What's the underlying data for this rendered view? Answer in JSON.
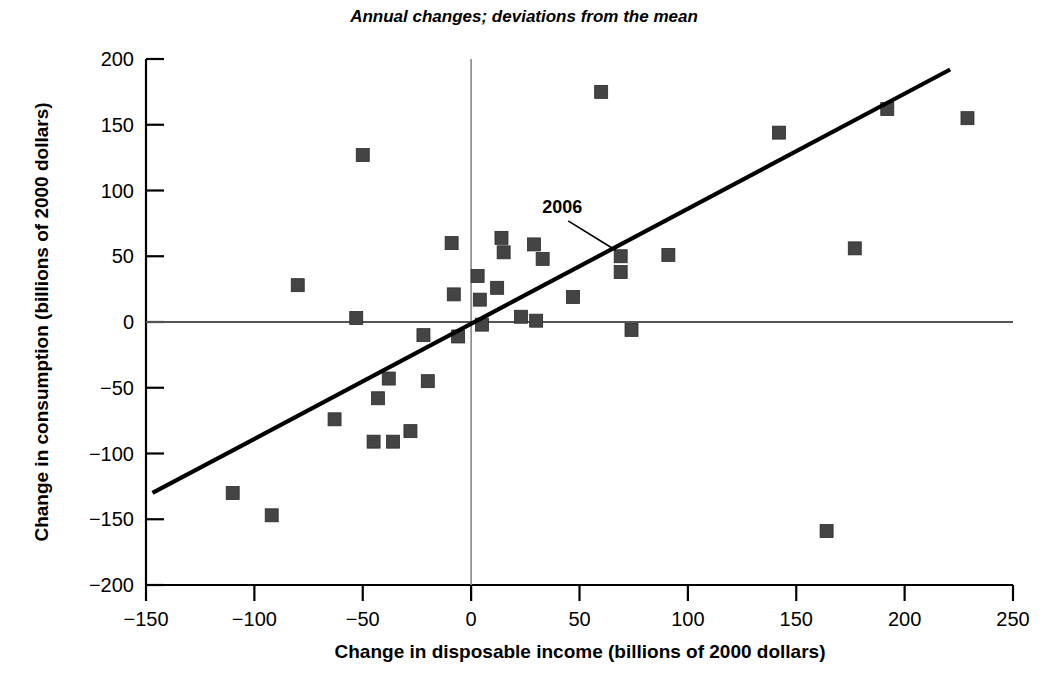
{
  "chart_data": {
    "type": "scatter",
    "title": "Annual changes; deviations from the mean",
    "xlabel": "Change in disposable income (billions of 2000 dollars)",
    "ylabel": "Change in consumption (billions of 2000 dollars)",
    "xlim": [
      -150,
      250
    ],
    "ylim": [
      -200,
      200
    ],
    "xticks": [
      -150,
      -100,
      -50,
      0,
      50,
      100,
      150,
      200,
      250
    ],
    "xtick_labels": [
      "−150",
      "−100",
      "−50",
      "0",
      "50",
      "100",
      "150",
      "200",
      "250"
    ],
    "yticks": [
      -200,
      -150,
      -100,
      -50,
      0,
      50,
      100,
      150,
      200
    ],
    "ytick_labels": [
      "−200",
      "−150",
      "−100",
      "−50",
      "0",
      "50",
      "100",
      "150",
      "200"
    ],
    "grid": false,
    "legend": "none",
    "zero_lines": {
      "x": 0,
      "y": 0
    },
    "marker": {
      "shape": "square",
      "color": "#444444",
      "size": 13
    },
    "points": [
      {
        "x": -110,
        "y": -130
      },
      {
        "x": -92,
        "y": -147
      },
      {
        "x": -80,
        "y": 28
      },
      {
        "x": -63,
        "y": -74
      },
      {
        "x": -53,
        "y": 3
      },
      {
        "x": -50,
        "y": 127
      },
      {
        "x": -45,
        "y": -91
      },
      {
        "x": -43,
        "y": -58
      },
      {
        "x": -38,
        "y": -43
      },
      {
        "x": -36,
        "y": -91
      },
      {
        "x": -28,
        "y": -83
      },
      {
        "x": -22,
        "y": -10
      },
      {
        "x": -20,
        "y": -45
      },
      {
        "x": -9,
        "y": 60
      },
      {
        "x": -8,
        "y": 21
      },
      {
        "x": -6,
        "y": -11
      },
      {
        "x": 3,
        "y": 35
      },
      {
        "x": 4,
        "y": 17
      },
      {
        "x": 5,
        "y": -2
      },
      {
        "x": 12,
        "y": 26
      },
      {
        "x": 14,
        "y": 64
      },
      {
        "x": 15,
        "y": 53
      },
      {
        "x": 23,
        "y": 4
      },
      {
        "x": 29,
        "y": 59
      },
      {
        "x": 30,
        "y": 1
      },
      {
        "x": 33,
        "y": 48
      },
      {
        "x": 47,
        "y": 19
      },
      {
        "x": 60,
        "y": 175
      },
      {
        "x": 69,
        "y": 50
      },
      {
        "x": 69,
        "y": 38
      },
      {
        "x": 74,
        "y": -6
      },
      {
        "x": 91,
        "y": 51
      },
      {
        "x": 142,
        "y": 144
      },
      {
        "x": 164,
        "y": -159
      },
      {
        "x": 177,
        "y": 56
      },
      {
        "x": 192,
        "y": 162
      },
      {
        "x": 229,
        "y": 155
      }
    ],
    "trendline": {
      "x0": -147,
      "y0": -130,
      "x1": 221,
      "y1": 192
    },
    "annotations": [
      {
        "label": "2006",
        "point_x": 69,
        "point_y": 50,
        "text_x": 42,
        "text_y": 83
      }
    ]
  },
  "colors": {
    "marker": "#444444",
    "axis": "#000000",
    "zero_line": "#888888",
    "trendline": "#000000",
    "background": "#ffffff"
  }
}
